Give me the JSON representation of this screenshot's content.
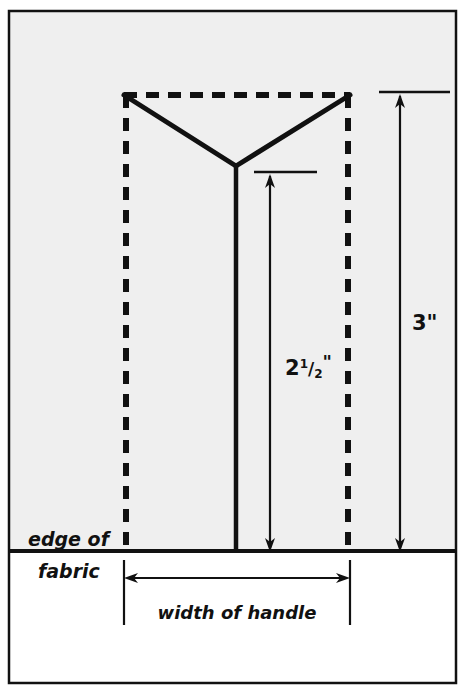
{
  "diagram": {
    "background_outer": "#ffffff",
    "fabric_fill": "#efefef",
    "below_fabric_fill": "#ffffff",
    "line_color": "#111111",
    "border_color": "#111111",
    "labels": {
      "height_total": "3\"",
      "height_total_value": "3",
      "height_inner_whole": "2",
      "height_inner_numerator": "1",
      "height_inner_slash": "/",
      "height_inner_denominator": "2",
      "height_inner_unit": "\"",
      "height_inner_full": "2 1/2\"",
      "edge_line_1": "edge of",
      "edge_line_2": "fabric",
      "width_of_handle": "width of handle"
    },
    "geometry": {
      "frame_left": 8,
      "frame_top": 10,
      "frame_right": 457,
      "frame_bottom": 684,
      "fabric_edge_y": 551,
      "dashed_left_x": 124,
      "dashed_right_x": 350,
      "dashed_top_y": 95,
      "apex_x": 236,
      "apex_y": 166,
      "dim_inner_x": 270,
      "dim_inner_top_y": 172,
      "dim_outer_x": 400,
      "dim_outer_top_y": 92,
      "width_arrow_y": 578,
      "width_ext_top_y": 560,
      "width_ext_bottom_y": 625
    }
  }
}
